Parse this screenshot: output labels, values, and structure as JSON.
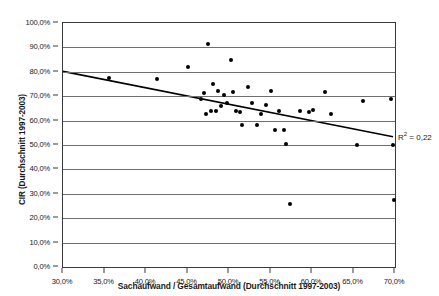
{
  "chart_data": {
    "type": "scatter",
    "title": "",
    "xlabel": "Sachaufwand / Gesamtaufwand (Durchschnitt 1997-2003)",
    "ylabel": "CIR (Durchschnitt 1997-2003)",
    "xlim": [
      30.0,
      70.0
    ],
    "ylim": [
      0.0,
      100.0
    ],
    "x_tick_labels": [
      "30,0%",
      "35,0%",
      "40,0%",
      "45,0%",
      "50,0%",
      "55,0%",
      "60,0%",
      "65,0%",
      "70,0%"
    ],
    "x_tick_values": [
      30,
      35,
      40,
      45,
      50,
      55,
      60,
      65,
      70
    ],
    "y_tick_labels": [
      "0,0%",
      "10,0%",
      "20,0%",
      "30,0%",
      "40,0%",
      "50,0%",
      "60,0%",
      "70,0%",
      "80,0%",
      "90,0%",
      "100,0%"
    ],
    "y_tick_values": [
      0,
      10,
      20,
      30,
      40,
      50,
      60,
      70,
      80,
      90,
      100
    ],
    "grid": "horizontal",
    "legend": "none",
    "points": [
      {
        "x": 35.6,
        "y": 77.6
      },
      {
        "x": 41.3,
        "y": 77.1
      },
      {
        "x": 45.0,
        "y": 82.0
      },
      {
        "x": 46.6,
        "y": 68.8
      },
      {
        "x": 47.0,
        "y": 71.5
      },
      {
        "x": 47.2,
        "y": 62.6
      },
      {
        "x": 47.5,
        "y": 91.5
      },
      {
        "x": 47.8,
        "y": 64.0
      },
      {
        "x": 48.1,
        "y": 74.8
      },
      {
        "x": 48.4,
        "y": 63.9
      },
      {
        "x": 48.7,
        "y": 72.2
      },
      {
        "x": 49.0,
        "y": 65.8
      },
      {
        "x": 49.4,
        "y": 70.5
      },
      {
        "x": 49.8,
        "y": 67.2
      },
      {
        "x": 50.2,
        "y": 85.0
      },
      {
        "x": 50.5,
        "y": 71.8
      },
      {
        "x": 50.9,
        "y": 63.8
      },
      {
        "x": 51.3,
        "y": 63.4
      },
      {
        "x": 51.6,
        "y": 58.2
      },
      {
        "x": 52.3,
        "y": 73.6
      },
      {
        "x": 52.8,
        "y": 67.4
      },
      {
        "x": 53.4,
        "y": 58.3
      },
      {
        "x": 53.9,
        "y": 62.8
      },
      {
        "x": 54.5,
        "y": 66.5
      },
      {
        "x": 55.1,
        "y": 72.1
      },
      {
        "x": 55.6,
        "y": 56.0
      },
      {
        "x": 56.0,
        "y": 64.0
      },
      {
        "x": 56.6,
        "y": 56.2
      },
      {
        "x": 56.9,
        "y": 50.4
      },
      {
        "x": 57.3,
        "y": 25.8
      },
      {
        "x": 58.6,
        "y": 63.9
      },
      {
        "x": 59.6,
        "y": 63.6
      },
      {
        "x": 60.1,
        "y": 64.3
      },
      {
        "x": 61.6,
        "y": 71.9
      },
      {
        "x": 62.3,
        "y": 62.7
      },
      {
        "x": 65.4,
        "y": 50.2
      },
      {
        "x": 66.1,
        "y": 68.2
      },
      {
        "x": 69.5,
        "y": 69.0
      },
      {
        "x": 69.8,
        "y": 50.0
      },
      {
        "x": 69.9,
        "y": 27.5
      }
    ],
    "trendline": {
      "x_start": 30.0,
      "y_start": 80.0,
      "x_end": 70.0,
      "y_end": 53.0
    },
    "annotations": [
      {
        "name": "r-squared",
        "text_prefix": "R",
        "text_sup": "2",
        "text_suffix": " = 0,22",
        "x": 70.0,
        "y": 50.0
      }
    ]
  }
}
